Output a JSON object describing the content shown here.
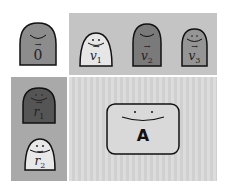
{
  "diagram": {
    "zero_vector": {
      "symbol": "0",
      "fill": "#8c8c8c"
    },
    "top_panel": {
      "background": "#c4c4c4",
      "items": [
        {
          "symbol": "v",
          "subscript": "1",
          "fill": "#e6e6e6"
        },
        {
          "symbol": "v",
          "subscript": "2",
          "fill": "#7a7a7a"
        },
        {
          "symbol": "v",
          "subscript": "3",
          "fill": "#959595"
        }
      ]
    },
    "left_panel": {
      "background": "#a9a9a9",
      "items": [
        {
          "symbol": "r",
          "subscript": "1",
          "fill": "#555555"
        },
        {
          "symbol": "r",
          "subscript": "2",
          "fill": "#e8e8e8"
        }
      ]
    },
    "main_panel": {
      "matrix_label": "A",
      "matrix_fill": "#d9d9d9"
    },
    "arrow_glyph": "→"
  }
}
